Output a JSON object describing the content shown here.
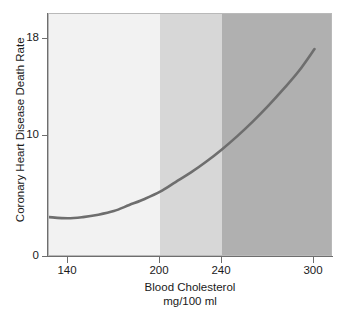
{
  "chart_data": {
    "type": "line",
    "title": "",
    "xlabel": "Blood Cholesterol mg/100 ml",
    "xlabel_line1": "Blood Cholesterol",
    "xlabel_line2": "mg/100 ml",
    "ylabel": "Coronary Heart Disease Death Rate",
    "xlim": [
      128,
      312
    ],
    "ylim": [
      0,
      20.1
    ],
    "xticks": [
      140,
      200,
      240,
      300
    ],
    "xtick_labels": [
      "140",
      "200",
      "240",
      "300"
    ],
    "yticks": [
      0,
      10,
      18
    ],
    "ytick_labels": [
      "0",
      "10",
      "18"
    ],
    "grid": false,
    "legend": "none",
    "series": [
      {
        "name": "Coronary heart disease death rate",
        "color": "#6e6e6e",
        "x": [
          128,
          140,
          150,
          160,
          170,
          180,
          190,
          200,
          210,
          220,
          230,
          240,
          250,
          260,
          270,
          280,
          290,
          300
        ],
        "values": [
          3.3,
          3.2,
          3.3,
          3.5,
          3.8,
          4.3,
          4.8,
          5.4,
          6.2,
          7.0,
          7.9,
          8.9,
          10.0,
          11.2,
          12.5,
          13.9,
          15.4,
          17.2
        ]
      }
    ],
    "bands": [
      {
        "name": "desirable",
        "from": 128,
        "to": 200,
        "color": "#f2f2f2"
      },
      {
        "name": "borderline-high",
        "from": 200,
        "to": 240,
        "color": "#d7d7d7"
      },
      {
        "name": "high",
        "from": 240,
        "to": 312,
        "color": "#b0b0b0"
      }
    ],
    "axis_color": "#6e6e6e",
    "frame_color": "#b9b9b9",
    "background": "#ffffff"
  }
}
